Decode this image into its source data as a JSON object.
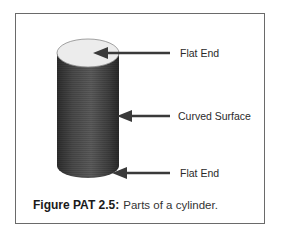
{
  "figure": {
    "number_label": "Figure PAT 2.5:",
    "caption_text": "Parts of a cylinder.",
    "colors": {
      "frame_border": "#6a6a6a",
      "top_face": "#ececec",
      "body_dark": "#3a3a3a",
      "body_light": "#5a5a5a",
      "arrow": "#3a3a3a",
      "text": "#2a2a2a"
    }
  },
  "labels": [
    {
      "id": "top",
      "text": "Flat End"
    },
    {
      "id": "side",
      "text": "Curved Surface"
    },
    {
      "id": "bottom",
      "text": "Flat End"
    }
  ]
}
